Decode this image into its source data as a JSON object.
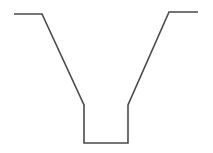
{
  "diagram": {
    "type": "cross-section-profile",
    "stroke_color": "#4a4a4a",
    "stroke_width": 1.6,
    "background": "#ffffff",
    "points": [
      [
        14,
        14
      ],
      [
        42,
        14
      ],
      [
        84,
        105
      ],
      [
        84,
        143
      ],
      [
        128,
        143
      ],
      [
        128,
        105
      ],
      [
        169,
        12
      ],
      [
        198,
        12
      ]
    ]
  }
}
